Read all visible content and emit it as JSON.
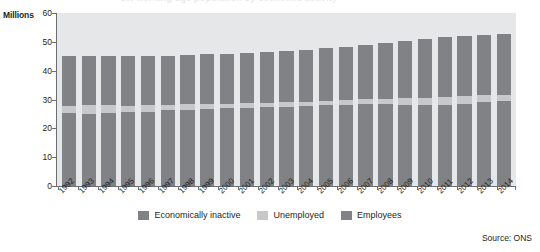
{
  "title_cut": "UK working-age population by economic activity",
  "axes": {
    "y_unit_label": "Millions",
    "y_ticks": [
      "60",
      "50",
      "40",
      "30",
      "20",
      "10",
      "0"
    ],
    "y_min": 0,
    "y_max": 60
  },
  "legend": {
    "items": [
      {
        "label": "Economically inactive",
        "color": "#808285",
        "key": "inactive"
      },
      {
        "label": "Unemployed",
        "color": "#c7c8ca",
        "key": "unemployed"
      },
      {
        "label": "Employees",
        "color": "#808285",
        "key": "employees"
      }
    ]
  },
  "source": "Source: ONS",
  "chart_data": {
    "type": "bar",
    "stacked": true,
    "title": "UK working-age population by economic activity",
    "xlabel": "",
    "ylabel": "Millions",
    "ylim": [
      0,
      60
    ],
    "ytick_step": 10,
    "grid": false,
    "legend_position": "bottom",
    "categories": [
      "1992",
      "1993",
      "1994",
      "1995",
      "1996",
      "1997",
      "1998",
      "1999",
      "2000",
      "2001",
      "2002",
      "2003",
      "2004",
      "2005",
      "2006",
      "2007",
      "2008",
      "2009",
      "2010",
      "2011",
      "2012",
      "2013",
      "2014"
    ],
    "series": [
      {
        "name": "Employees",
        "color": "#808285",
        "values": [
          25.2,
          25.1,
          25.3,
          25.5,
          25.7,
          26.2,
          26.5,
          26.8,
          27.0,
          27.2,
          27.3,
          27.5,
          27.7,
          28.0,
          28.2,
          28.4,
          28.5,
          28.0,
          28.0,
          28.2,
          28.6,
          29.0,
          29.6
        ]
      },
      {
        "name": "Unemployed",
        "color": "#c7c8ca",
        "values": [
          2.7,
          2.9,
          2.7,
          2.4,
          2.3,
          2.0,
          1.8,
          1.7,
          1.6,
          1.5,
          1.5,
          1.5,
          1.4,
          1.5,
          1.7,
          1.7,
          1.8,
          2.5,
          2.5,
          2.6,
          2.6,
          2.4,
          2.0
        ]
      },
      {
        "name": "Economically inactive",
        "color": "#808285",
        "values": [
          17.1,
          17.0,
          17.0,
          17.1,
          17.0,
          17.0,
          17.1,
          17.2,
          17.2,
          17.3,
          17.8,
          18.0,
          18.2,
          18.3,
          18.4,
          18.8,
          19.2,
          19.8,
          20.4,
          20.8,
          20.8,
          20.9,
          21.0
        ]
      }
    ],
    "totals": [
      45.0,
      45.0,
      45.0,
      45.0,
      45.0,
      45.2,
      45.4,
      45.7,
      45.8,
      46.0,
      46.6,
      47.0,
      47.3,
      47.8,
      48.3,
      48.9,
      49.5,
      50.3,
      50.9,
      51.6,
      52.0,
      52.3,
      52.6
    ]
  }
}
